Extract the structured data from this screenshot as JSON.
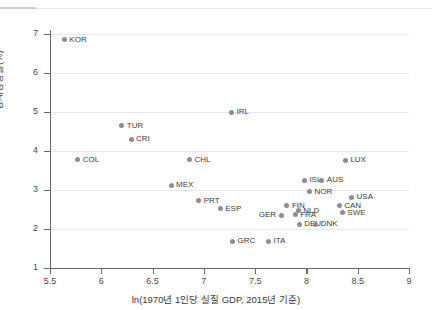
{
  "header": {
    "cut_off_text": "—— ——  ——— — —— ———   ————"
  },
  "chart_data": {
    "type": "scatter",
    "title": "",
    "xlabel": "ln(1970년 1인당 실질 GDP, 2015년 기준)",
    "ylabel": "경제성장률(%)",
    "xlim": [
      5.5,
      9
    ],
    "ylim": [
      1,
      7
    ],
    "xticks": [
      "5.5",
      "6",
      "6.5",
      "7",
      "7.5",
      "8",
      "8.5",
      "9"
    ],
    "xtick_values": [
      5.5,
      6,
      6.5,
      7,
      7.5,
      8,
      8.5,
      9
    ],
    "yticks": [
      "1",
      "2",
      "3",
      "4",
      "5",
      "6",
      "7"
    ],
    "ytick_values": [
      1,
      2,
      3,
      4,
      5,
      6,
      7
    ],
    "grid": "horizontal",
    "legend": "none",
    "marker_color": "#8d8d92",
    "points": [
      {
        "label": "KOR",
        "x": 5.64,
        "y": 6.85,
        "lx": 6,
        "ly": 0
      },
      {
        "label": "TUR",
        "x": 6.2,
        "y": 4.65,
        "lx": 6,
        "ly": 0
      },
      {
        "label": "CRI",
        "x": 6.29,
        "y": 4.3,
        "lx": 6,
        "ly": 0
      },
      {
        "label": "COL",
        "x": 5.77,
        "y": 3.77,
        "lx": 6,
        "ly": 0
      },
      {
        "label": "IRL",
        "x": 7.27,
        "y": 5.0,
        "lx": 6,
        "ly": 0
      },
      {
        "label": "CHL",
        "x": 6.86,
        "y": 3.78,
        "lx": 6,
        "ly": 0
      },
      {
        "label": "LUX",
        "x": 8.38,
        "y": 3.76,
        "lx": 6,
        "ly": 0
      },
      {
        "label": "MEX",
        "x": 6.68,
        "y": 3.12,
        "lx": 6,
        "ly": 0
      },
      {
        "label": "ISL",
        "x": 7.98,
        "y": 3.25,
        "lx": 6,
        "ly": 0
      },
      {
        "label": "AUS",
        "x": 8.15,
        "y": 3.25,
        "lx": 6,
        "ly": 0
      },
      {
        "label": "NOR",
        "x": 8.03,
        "y": 2.95,
        "lx": 6,
        "ly": 0
      },
      {
        "label": "USA",
        "x": 8.44,
        "y": 2.82,
        "lx": 6,
        "ly": 0
      },
      {
        "label": "PRT",
        "x": 6.95,
        "y": 2.72,
        "lx": 6,
        "ly": 0
      },
      {
        "label": "ESP",
        "x": 7.16,
        "y": 2.52,
        "lx": 6,
        "ly": 0
      },
      {
        "label": "FIN",
        "x": 7.81,
        "y": 2.6,
        "lx": 6,
        "ly": 0
      },
      {
        "label": "CAN",
        "x": 8.32,
        "y": 2.6,
        "lx": 6,
        "ly": 0
      },
      {
        "label": "NLD",
        "x": 7.92,
        "y": 2.47,
        "lx": 6,
        "ly": 0
      },
      {
        "label": "SWE",
        "x": 8.35,
        "y": 2.42,
        "lx": 6,
        "ly": 0
      },
      {
        "label": "GER",
        "x": 7.76,
        "y": 2.35,
        "lx": -22,
        "ly": 0
      },
      {
        "label": "FRA",
        "x": 7.89,
        "y": 2.37,
        "lx": 6,
        "ly": 0
      },
      {
        "label": "DEU",
        "x": 7.93,
        "y": 2.12,
        "lx": 6,
        "ly": 0
      },
      {
        "label": "DNK",
        "x": 8.09,
        "y": 2.12,
        "lx": 6,
        "ly": 0
      },
      {
        "label": "GRC",
        "x": 7.28,
        "y": 1.68,
        "lx": 6,
        "ly": 0
      },
      {
        "label": "ITA",
        "x": 7.63,
        "y": 1.68,
        "lx": 6,
        "ly": 0
      }
    ]
  }
}
